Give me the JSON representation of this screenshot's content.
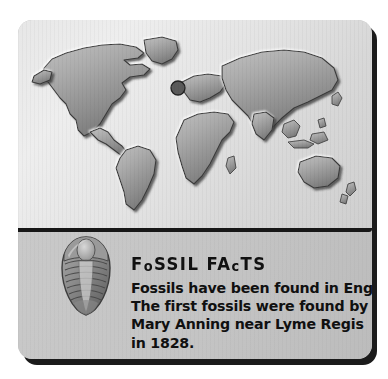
{
  "card": {
    "background_color": "#c6c6c6",
    "shadow_color": "#1b1b1b"
  },
  "map_panel": {
    "name": "world-map",
    "style": "embossed grayscale relief world map",
    "background_color": "#e7e7e7",
    "land_color": "#a8a8a8",
    "marker": {
      "name": "england-location-marker",
      "label": "England",
      "color": "#5a5a5a"
    },
    "continents": [
      "North America",
      "South America",
      "Greenland",
      "Europe",
      "Africa",
      "Asia",
      "Australia",
      "New Zealand",
      "Indonesia",
      "Japan",
      "British Isles",
      "Madagascar"
    ]
  },
  "fossil": {
    "name": "trilobite-fossil",
    "label": "Trilobite fossil"
  },
  "fact_box": {
    "heading": "FoSSIL FAcTS",
    "heading_parts": [
      {
        "text": "F",
        "case": "cap"
      },
      {
        "text": "o",
        "case": "lower"
      },
      {
        "text": "SSIL",
        "case": "cap"
      },
      {
        "text": " ",
        "case": "cap"
      },
      {
        "text": "FA",
        "case": "cap"
      },
      {
        "text": "c",
        "case": "lower"
      },
      {
        "text": "TS",
        "case": "cap"
      }
    ],
    "lines": [
      "Fossils have been found in England.",
      "The first fossils were found by",
      "Mary Anning near Lyme Regis",
      "in 1828."
    ],
    "text_color": "#101010"
  }
}
